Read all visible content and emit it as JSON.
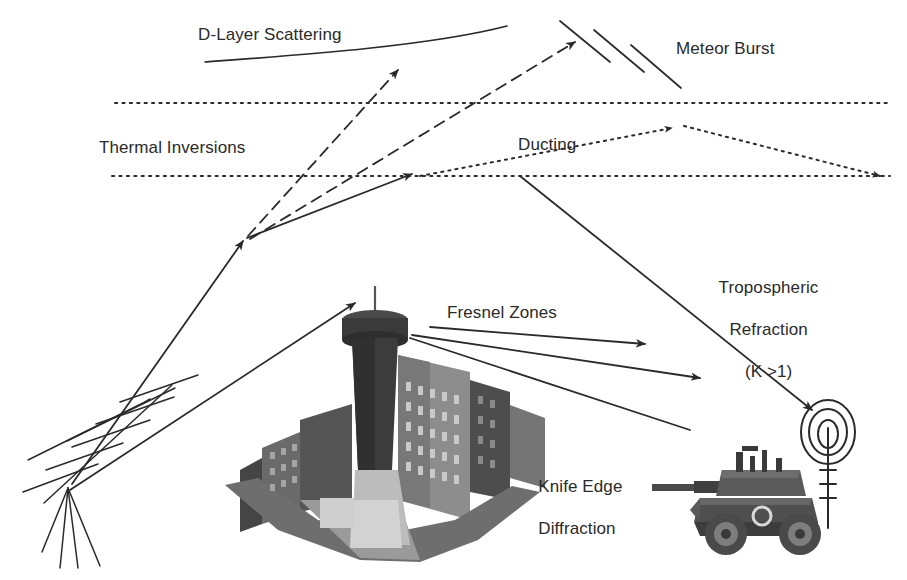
{
  "diagram": {
    "background_color": "#ffffff",
    "ink_color": "#2a2a2a",
    "labels": {
      "d_layer_scattering": "D-Layer Scattering",
      "meteor_burst": "Meteor Burst",
      "thermal_inversions": "Thermal Inversions",
      "ducting": "Ducting",
      "tropospheric_refraction_line1": "Tropospheric",
      "tropospheric_refraction_line2": "Refraction",
      "tropospheric_refraction_line3": "(K >1)",
      "fresnel_zones": "Fresnel Zones",
      "knife_edge_line1": "Knife Edge",
      "knife_edge_line2": "Diffraction"
    },
    "layers": {
      "upper_layer_y": 103,
      "lower_layer_y": 176,
      "layer_x_start": 115,
      "layer_x_end": 890,
      "style": "dotted"
    },
    "elements": {
      "transmit_antenna": "yagi-antenna",
      "receive_antenna": "loop-antenna",
      "obstruction": "city-skyline-tower",
      "receiver_platform": "armored-vehicle"
    },
    "paths": [
      {
        "name": "uplink-to-inversion",
        "style": "solid",
        "arrow": true
      },
      {
        "name": "d-layer-scatter-ray",
        "style": "dashed",
        "arrow": true
      },
      {
        "name": "meteor-burst-ray",
        "style": "dashed",
        "arrow": true
      },
      {
        "name": "ducting-ray",
        "style": "dotted",
        "arrow": true
      },
      {
        "name": "tropospheric-refraction-ray",
        "style": "solid",
        "arrow": true
      },
      {
        "name": "fresnel-zone-rays",
        "style": "solid",
        "arrow": true,
        "count": 3
      },
      {
        "name": "line-of-sight-to-tower",
        "style": "solid",
        "arrow": true
      }
    ]
  }
}
